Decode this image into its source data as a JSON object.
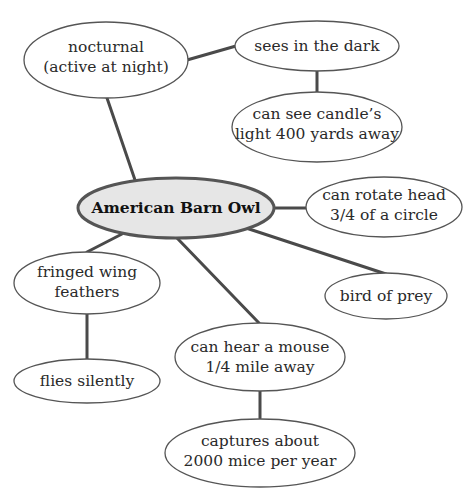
{
  "concept_map": {
    "title": "American Barn Owl",
    "center": {
      "id": "center",
      "lines": [
        "American Barn Owl"
      ]
    },
    "nodes": [
      {
        "id": "nocturnal",
        "lines": [
          "nocturnal",
          "(active at night)"
        ]
      },
      {
        "id": "sees-dark",
        "lines": [
          "sees in the dark"
        ]
      },
      {
        "id": "candle",
        "lines": [
          "can see candle’s",
          "light 400 yards away"
        ]
      },
      {
        "id": "rotate",
        "lines": [
          "can rotate head",
          "3/4 of a circle"
        ]
      },
      {
        "id": "fringed",
        "lines": [
          "fringed wing",
          "feathers"
        ]
      },
      {
        "id": "prey",
        "lines": [
          "bird of prey"
        ]
      },
      {
        "id": "hear",
        "lines": [
          "can hear a mouse",
          "1/4 mile away"
        ]
      },
      {
        "id": "silent",
        "lines": [
          "flies silently"
        ]
      },
      {
        "id": "captures",
        "lines": [
          "captures about",
          "2000 mice per year"
        ]
      }
    ],
    "edges": [
      [
        "center",
        "nocturnal"
      ],
      [
        "nocturnal",
        "sees-dark"
      ],
      [
        "sees-dark",
        "candle"
      ],
      [
        "center",
        "rotate"
      ],
      [
        "center",
        "fringed"
      ],
      [
        "fringed",
        "silent"
      ],
      [
        "center",
        "hear"
      ],
      [
        "hear",
        "captures"
      ],
      [
        "center",
        "prey"
      ]
    ]
  }
}
